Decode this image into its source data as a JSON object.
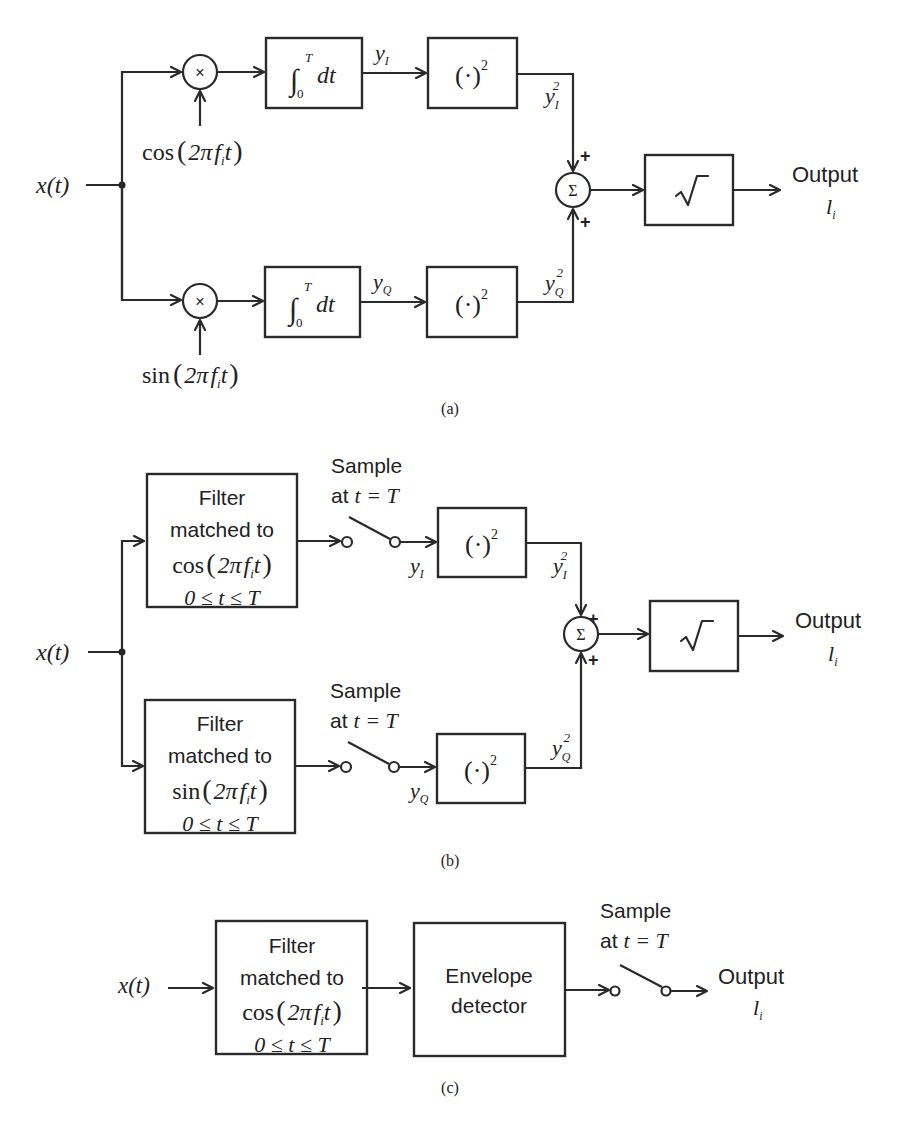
{
  "figure": {
    "panels": [
      {
        "id": "a",
        "caption": "(a)",
        "input_label": "x(t)",
        "upper_branch": {
          "multiplier_symbol": "×",
          "carrier": "cos(2πf_i t)",
          "carrier_parts": {
            "fn": "cos",
            "open": "(",
            "two_pi": "2π",
            "f": "f",
            "sub": "i",
            "t": "t",
            "close": ")"
          },
          "integrator": {
            "integral": "∫",
            "upper": "T",
            "lower": "0",
            "body": "dt"
          },
          "output_label": {
            "base": "y",
            "sub": "I"
          },
          "squarer": {
            "body": "(·)",
            "sup": "2"
          },
          "squared_label": {
            "base": "y",
            "sub": "I",
            "sup": "2"
          },
          "sign": "+"
        },
        "lower_branch": {
          "multiplier_symbol": "×",
          "carrier": "sin(2πf_i t)",
          "carrier_parts": {
            "fn": "sin",
            "open": "(",
            "two_pi": "2π",
            "f": "f",
            "sub": "i",
            "t": "t",
            "close": ")"
          },
          "integrator": {
            "integral": "∫",
            "upper": "T",
            "lower": "0",
            "body": "dt"
          },
          "output_label": {
            "base": "y",
            "sub": "Q"
          },
          "squarer": {
            "body": "(·)",
            "sup": "2"
          },
          "squared_label": {
            "base": "y",
            "sub": "Q",
            "sup": "2"
          },
          "sign": "+"
        },
        "summer_symbol": "Σ",
        "sqrt_symbol": "√",
        "output": {
          "label": "Output",
          "symbol_base": "l",
          "symbol_sub": "i"
        }
      },
      {
        "id": "b",
        "caption": "(b)",
        "input_label": "x(t)",
        "upper_branch": {
          "filter_lines": [
            "Filter",
            "matched to",
            "cos(2πf_i t)",
            "0 ≤ t ≤ T"
          ],
          "filter_parts": {
            "fn": "cos",
            "open": "(",
            "two_pi": "2π",
            "f": "f",
            "sub": "i",
            "t": "t",
            "close": ")"
          },
          "range": "0≤t≤T",
          "sampler_line1": "Sample",
          "sampler_line2_prefix": "at",
          "sampler_line2_eq": "t = T",
          "output_label": {
            "base": "y",
            "sub": "I"
          },
          "squarer": {
            "body": "(·)",
            "sup": "2"
          },
          "squared_label": {
            "base": "y",
            "sub": "I",
            "sup": "2"
          },
          "sign": "+"
        },
        "lower_branch": {
          "filter_lines": [
            "Filter",
            "matched to",
            "sin(2πf_i t)",
            "0 ≤ t ≤ T"
          ],
          "filter_parts": {
            "fn": "sin",
            "open": "(",
            "two_pi": "2π",
            "f": "f",
            "sub": "i",
            "t": "t",
            "close": ")"
          },
          "range": "0≤t≤T",
          "sampler_line1": "Sample",
          "sampler_line2_prefix": "at",
          "sampler_line2_eq": "t = T",
          "output_label": {
            "base": "y",
            "sub": "Q"
          },
          "squarer": {
            "body": "(·)",
            "sup": "2"
          },
          "squared_label": {
            "base": "y",
            "sub": "Q",
            "sup": "2"
          },
          "sign": "+"
        },
        "summer_symbol": "Σ",
        "sqrt_symbol": "√",
        "output": {
          "label": "Output",
          "symbol_base": "l",
          "symbol_sub": "i"
        }
      },
      {
        "id": "c",
        "caption": "(c)",
        "input_label": "x(t)",
        "filter_lines": [
          "Filter",
          "matched to",
          "cos(2πf_i t)",
          "0 ≤ t ≤ T"
        ],
        "filter_parts": {
          "fn": "cos",
          "open": "(",
          "two_pi": "2π",
          "f": "f",
          "sub": "i",
          "t": "t",
          "close": ")"
        },
        "range": "0≤t≤T",
        "envelope_lines": [
          "Envelope",
          "detector"
        ],
        "sampler_line1": "Sample",
        "sampler_line2_prefix": "at",
        "sampler_line2_eq": "t = T",
        "output": {
          "label": "Output",
          "symbol_base": "l",
          "symbol_sub": "i"
        }
      }
    ]
  }
}
